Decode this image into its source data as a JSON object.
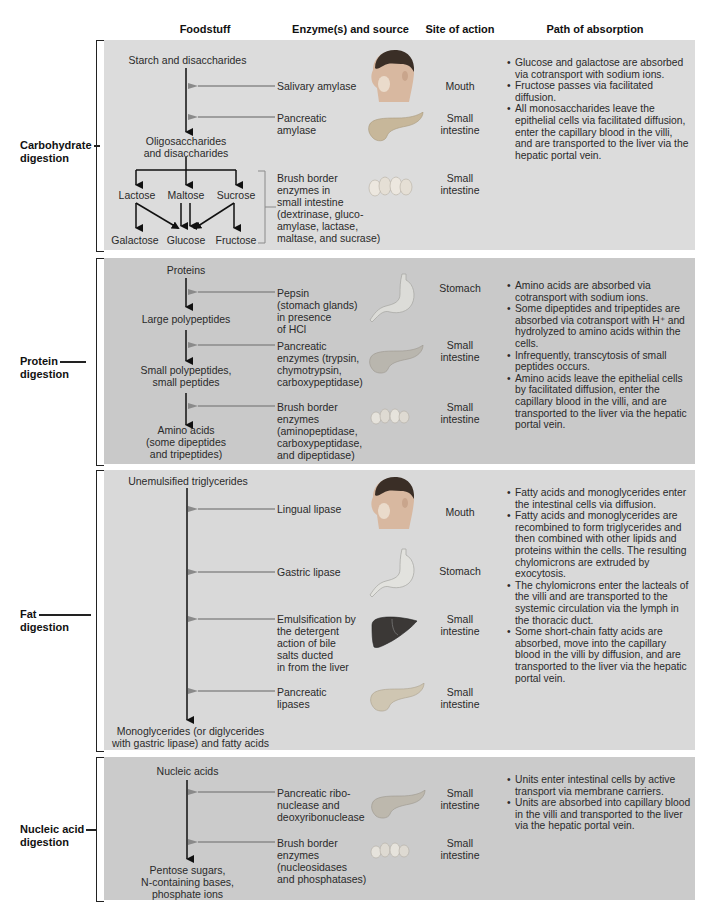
{
  "headers": {
    "foodstuff": "Foodstuff",
    "enzymes": "Enzyme(s) and source",
    "site": "Site of action",
    "absorption": "Path of absorption"
  },
  "carbohydrate": {
    "label_line1": "Carbohydrate",
    "label_line2": "digestion",
    "start": "Starch and disaccharides",
    "middle_line1": "Oligosaccharides",
    "middle_line2": "and disaccharides",
    "disaccharides": [
      "Lactose",
      "Maltose",
      "Sucrose"
    ],
    "monosaccharides": [
      "Galactose",
      "Glucose",
      "Fructose"
    ],
    "enzymes": [
      {
        "lines": [
          "Salivary amylase"
        ],
        "icon": "head-mouth-icon",
        "site": [
          "Mouth"
        ]
      },
      {
        "lines": [
          "Pancreatic",
          "amylase"
        ],
        "icon": "pancreas-icon",
        "site": [
          "Small",
          "intestine"
        ]
      },
      {
        "lines": [
          "Brush border",
          "enzymes in",
          "small intestine",
          "(dextrinase, gluco-",
          "amylase, lactase,",
          "maltase, and sucrase)"
        ],
        "icon": "intestinal-villi-icon",
        "site": [
          "Small",
          "intestine"
        ]
      }
    ],
    "absorption": [
      "Glucose and galactose are absorbed via cotransport with sodium ions.",
      "Fructose passes via facilitated diffusion.",
      "All monosaccharides leave the epithelial cells via facilitated diffusion, enter the capillary blood in the villi, and are transported to the liver via the hepatic portal vein."
    ]
  },
  "protein": {
    "label_line1": "Protein",
    "label_line2": "digestion",
    "steps": [
      [
        "Proteins"
      ],
      [
        "Large polypeptides"
      ],
      [
        "Small polypeptides,",
        "small peptides"
      ],
      [
        "Amino acids",
        "(some dipeptides",
        "and tripeptides)"
      ]
    ],
    "enzymes": [
      {
        "lines": [
          "Pepsin",
          "(stomach glands)",
          "in presence",
          "of HCl"
        ],
        "icon": "stomach-icon",
        "site": [
          "Stomach"
        ]
      },
      {
        "lines": [
          "Pancreatic",
          "enzymes (trypsin,",
          "chymotrypsin,",
          "carboxypeptidase)"
        ],
        "icon": "pancreas-icon",
        "site": [
          "Small",
          "intestine"
        ]
      },
      {
        "lines": [
          "Brush border",
          "enzymes",
          "(aminopeptidase,",
          "carboxypeptidase,",
          "and dipeptidase)"
        ],
        "icon": "intestinal-villi-icon",
        "site": [
          "Small",
          "intestine"
        ]
      }
    ],
    "absorption": [
      "Amino acids are absorbed via cotransport with sodium ions.",
      "Some dipeptides and tripeptides are absorbed via cotransport with H⁺ and hydrolyzed to amino acids within the cells.",
      "Infrequently, transcytosis of small peptides occurs.",
      "Amino acids leave the epithelial cells by facilitated diffusion, enter the capillary blood in the villi, and are transported to the liver via the hepatic portal vein."
    ]
  },
  "fat": {
    "label_line1": "Fat",
    "label_line2": "digestion",
    "start": "Unemulsified triglycerides",
    "end_line1": "Monoglycerides (or diglycerides",
    "end_line2": "with gastric lipase) and fatty acids",
    "enzymes": [
      {
        "lines": [
          "Lingual lipase"
        ],
        "icon": "head-mouth-icon",
        "site": [
          "Mouth"
        ]
      },
      {
        "lines": [
          "Gastric lipase"
        ],
        "icon": "stomach-icon",
        "site": [
          "Stomach"
        ]
      },
      {
        "lines": [
          "Emulsification by",
          "the detergent",
          "action of bile",
          "salts ducted",
          "in from the liver"
        ],
        "icon": "liver-icon",
        "site": [
          "Small",
          "intestine"
        ]
      },
      {
        "lines": [
          "Pancreatic",
          "lipases"
        ],
        "icon": "pancreas-icon",
        "site": [
          "Small",
          "intestine"
        ]
      }
    ],
    "absorption": [
      "Fatty acids and monoglycerides enter the intestinal cells via diffusion.",
      "Fatty acids and monoglycerides are recombined to form triglycerides and then combined with other lipids and proteins within the cells. The resulting chylomicrons are extruded by exocytosis.",
      "The chylomicrons enter the lacteals of the villi and are transported to the systemic circulation via the lymph in the thoracic duct.",
      "Some short-chain fatty acids are absorbed, move into the capillary blood in the villi by diffusion, and are transported to the liver via the hepatic portal vein."
    ]
  },
  "nucleic": {
    "label_line1": "Nucleic acid",
    "label_line2": "digestion",
    "start": "Nucleic acids",
    "end": [
      "Pentose sugars,",
      "N-containing bases,",
      "phosphate ions"
    ],
    "enzymes": [
      {
        "lines": [
          "Pancreatic ribo-",
          "nuclease and",
          "deoxyribonuclease"
        ],
        "icon": "pancreas-icon",
        "site": [
          "Small",
          "intestine"
        ]
      },
      {
        "lines": [
          "Brush border",
          "enzymes",
          "(nucleosidases",
          "and phosphatases)"
        ],
        "icon": "intestinal-villi-icon",
        "site": [
          "Small",
          "intestine"
        ]
      }
    ],
    "absorption": [
      "Units enter intestinal cells by active transport via membrane carriers.",
      "Units are absorbed into capillary blood in the villi and transported to the liver via the hepatic portal vein."
    ]
  },
  "colors": {
    "arrow_main": "#111111",
    "arrow_enzyme": "#8a8a8a",
    "panel_carb": "#dcdcdc",
    "panel_protein": "#c9c9c9",
    "panel_fat": "#d9d9d9",
    "panel_nucleic": "#cbcbcb"
  }
}
